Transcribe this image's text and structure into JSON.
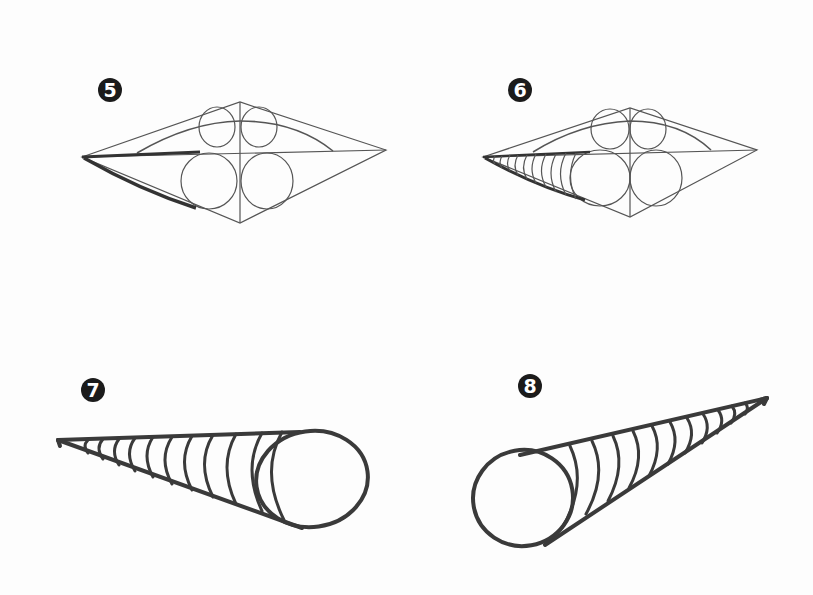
{
  "figure": {
    "type": "drawing-tutorial-steps",
    "background": "#ffffff",
    "ink_color": "#3a3a3a",
    "steps": [
      {
        "number": "5",
        "label": "5",
        "subject": "lips-construction",
        "description": "Diamond guide with upper and lower lip circles; lower-left edge of lower lip darkened"
      },
      {
        "number": "6",
        "label": "6",
        "subject": "lips-construction",
        "description": "Diamond guide with lip circles; contour arcs added to lower-left of lower lip"
      },
      {
        "number": "7",
        "label": "7",
        "subject": "cone-left",
        "description": "Cone pointing left with cross-contour arcs and circular end"
      },
      {
        "number": "8",
        "label": "8",
        "subject": "cone-right",
        "description": "Cone pointing up-right with cross-contour arcs and circular end"
      }
    ]
  }
}
